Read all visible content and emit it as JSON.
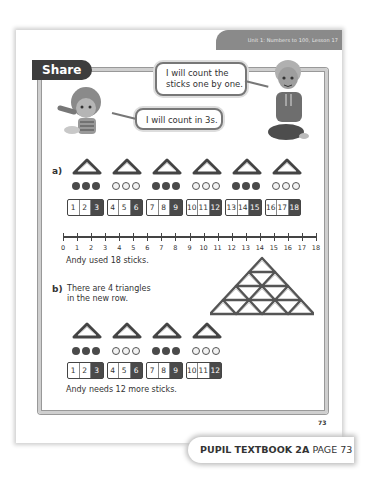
{
  "header": {
    "lesson_label": "Unit 1: Numbers to 100, Lesson 17"
  },
  "section": {
    "title": "Share"
  },
  "speech": {
    "boy": "I will count the sticks one by one.",
    "girl": "I will count in 3s."
  },
  "part_a": {
    "label": "a)",
    "triangle_count": 6,
    "bead_groups": [
      "dark",
      "light",
      "dark",
      "light",
      "dark",
      "light"
    ],
    "groups": [
      [
        "1",
        "2",
        "3"
      ],
      [
        "4",
        "5",
        "6"
      ],
      [
        "7",
        "8",
        "9"
      ],
      [
        "10",
        "11",
        "12"
      ],
      [
        "13",
        "14",
        "15"
      ],
      [
        "16",
        "17",
        "18"
      ]
    ],
    "number_line": {
      "ticks": [
        "0",
        "1",
        "2",
        "3",
        "4",
        "5",
        "6",
        "7",
        "8",
        "9",
        "10",
        "11",
        "12",
        "13",
        "14",
        "15",
        "16",
        "17",
        "18"
      ]
    },
    "answer": "Andy used 18 sticks."
  },
  "part_b": {
    "label": "b)",
    "prompt_line1": "There are 4 triangles",
    "prompt_line2": "in the new row.",
    "pyramid_rows": [
      1,
      2,
      3,
      4
    ],
    "triangle_count": 4,
    "bead_groups": [
      "dark",
      "light",
      "dark",
      "light"
    ],
    "groups": [
      [
        "1",
        "2",
        "3"
      ],
      [
        "4",
        "5",
        "6"
      ],
      [
        "7",
        "8",
        "9"
      ],
      [
        "10",
        "11",
        "12"
      ]
    ],
    "answer": "Andy needs 12 more sticks."
  },
  "page_number": "73",
  "footer": {
    "book": "PUPIL TEXTBOOK 2A",
    "page": "PAGE 73"
  }
}
